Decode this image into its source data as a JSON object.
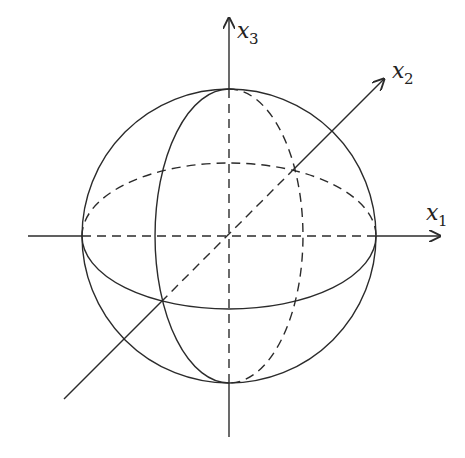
{
  "diagram": {
    "type": "unit-sphere-with-coordinate-axes",
    "axes": [
      {
        "id": "x1",
        "label": "x",
        "subscript": "1",
        "direction": "right"
      },
      {
        "id": "x2",
        "label": "x",
        "subscript": "2",
        "direction": "diagonal-up-right"
      },
      {
        "id": "x3",
        "label": "x",
        "subscript": "3",
        "direction": "up"
      }
    ],
    "elements": [
      {
        "name": "sphere-outline",
        "style": "solid"
      },
      {
        "name": "equator",
        "front": "solid",
        "back": "dashed"
      },
      {
        "name": "meridian-x2x3",
        "front": "solid",
        "back": "dashed"
      },
      {
        "name": "axes-inside-sphere",
        "style": "dashed"
      },
      {
        "name": "axes-outside-sphere",
        "style": "solid"
      }
    ],
    "colors": {
      "stroke": "#2b2b2b",
      "background": "#ffffff"
    }
  }
}
